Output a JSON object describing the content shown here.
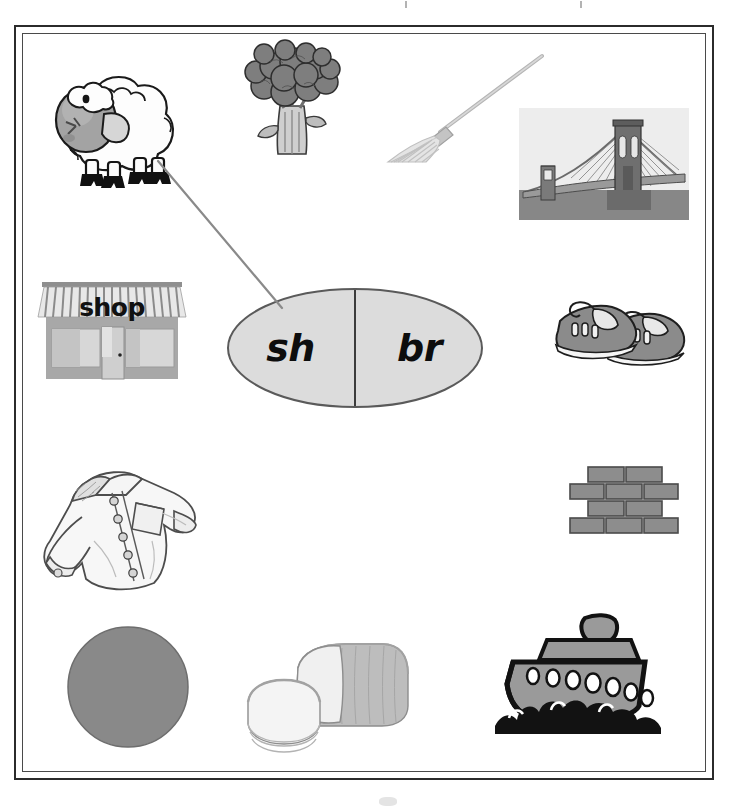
{
  "worksheet": {
    "type": "phonics-digraph-blend-sort",
    "frame": {
      "style": "double-line-rectangle",
      "color": "#2b2b2b"
    }
  },
  "sorting_oval": {
    "left_label": "sh",
    "right_label": "br",
    "fill_color": "#dcdcdc",
    "stroke_color": "#5a5a5a",
    "divider": "vertical-line"
  },
  "connections": [
    {
      "from": "sheep",
      "to": "sh",
      "drawn": true,
      "color": "#8a8a8a"
    }
  ],
  "pictures": [
    {
      "id": "sheep",
      "name": "sheep",
      "sound": "sh",
      "row": 1,
      "column": "left"
    },
    {
      "id": "broccoli",
      "name": "broccoli",
      "sound": "br",
      "row": 1,
      "column": "center"
    },
    {
      "id": "broom",
      "name": "broom",
      "sound": "br",
      "row": 1,
      "column": "right-center"
    },
    {
      "id": "bridge",
      "name": "bridge",
      "sound": "br",
      "row": 1,
      "column": "right"
    },
    {
      "id": "shop",
      "name": "shop",
      "sound": "sh",
      "row": 2,
      "column": "left"
    },
    {
      "id": "shoes",
      "name": "shoes",
      "sound": "sh",
      "row": 2,
      "column": "right"
    },
    {
      "id": "shirt",
      "name": "shirt",
      "sound": "sh",
      "row": 3,
      "column": "left"
    },
    {
      "id": "bricks",
      "name": "bricks",
      "sound": "br",
      "row": 3,
      "column": "right"
    },
    {
      "id": "ball",
      "name": "ball",
      "sound": "b",
      "row": 4,
      "column": "left"
    },
    {
      "id": "bread",
      "name": "bread",
      "sound": "br",
      "row": 4,
      "column": "center"
    },
    {
      "id": "ship",
      "name": "ship",
      "sound": "sh",
      "row": 4,
      "column": "right"
    }
  ],
  "shop_sign": {
    "text": "shop"
  },
  "colors": {
    "page_background": "#ffffff",
    "frame": "#2b2b2b",
    "oval_fill": "#dcdcdc",
    "ink": "#111111",
    "clipart_gray": "#8e8e8e",
    "clipart_dark": "#5f5f5f",
    "clipart_light": "#d8d8d8"
  }
}
